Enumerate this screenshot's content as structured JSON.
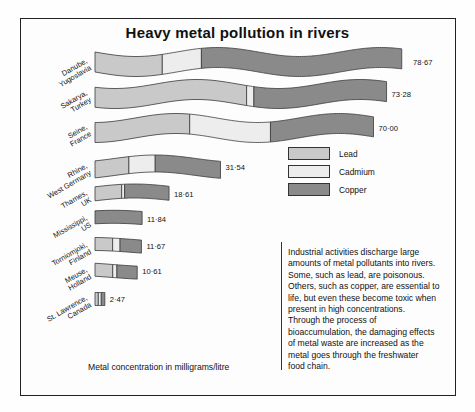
{
  "title": "Heavy metal pollution in rivers",
  "caption": "Metal concentration in milligrams/litre",
  "legend": {
    "items": [
      {
        "label": "Lead",
        "color": "#c9c9c9"
      },
      {
        "label": "Cadmium",
        "color": "#ededed"
      },
      {
        "label": "Copper",
        "color": "#8a8a8a"
      }
    ]
  },
  "paragraph": [
    "Industrial activities discharge large",
    "amounts of metal pollutants into rivers.",
    "Some, such as lead, are poisonous.",
    "Others, such as copper, are essential to",
    "life, but even these become toxic when",
    "present in high concentrations.",
    "Through the process of",
    "bioaccumulation, the damaging effects",
    "of metal waste are increased as the",
    "metal goes through the freshwater",
    "food chain."
  ],
  "chart_data": {
    "type": "bar",
    "title": "Heavy metal pollution in rivers",
    "xlabel": "Metal concentration in milligrams/litre",
    "ylabel": "",
    "unit": "milligrams/litre",
    "stacked": true,
    "series": [
      {
        "name": "Lead",
        "color": "#c9c9c9"
      },
      {
        "name": "Cadmium",
        "color": "#ededed"
      },
      {
        "name": "Copper",
        "color": "#8a8a8a"
      }
    ],
    "categories": [
      "Danube, Yugoslavia",
      "Sakarya, Turkey",
      "Seine, France",
      "Rhine, West Germany",
      "Thames, UK",
      "Mississippi, US",
      "Torniomjoki, Finland",
      "Meuse, Holland",
      "St. Lawrence, Canada"
    ],
    "totals": [
      78.67,
      73.28,
      70.0,
      31.54,
      18.61,
      11.84,
      11.67,
      10.61,
      2.47
    ],
    "total_labels": [
      "78·67",
      "73·28",
      "70·00",
      "31·54",
      "18·61",
      "11·84",
      "11·67",
      "10·61",
      "2·47"
    ],
    "rows": [
      {
        "label1": "Danube,",
        "label2": "Yugoslavia",
        "total_label": "78·67",
        "segments": [
          21.5,
          12.5,
          64.0
        ]
      },
      {
        "label1": "Sakarya,",
        "label2": "Turkey",
        "total_label": "73·28",
        "segments": [
          52.0,
          2.5,
          45.5
        ]
      },
      {
        "label1": "Seine,",
        "label2": "France",
        "total_label": "70·00",
        "segments": [
          34.0,
          29.0,
          37.0
        ]
      },
      {
        "label1": "Rhine,",
        "label2": "West Germany",
        "total_label": "31·54",
        "segments": [
          27.0,
          21.0,
          52.0
        ]
      },
      {
        "label1": "Thames,",
        "label2": "UK",
        "total_label": "18·61",
        "segments": [
          36.0,
          4.0,
          60.0
        ]
      },
      {
        "label1": "Mississippi,",
        "label2": "US",
        "total_label": "11·84",
        "segments": [
          0.0,
          0.0,
          100.0
        ]
      },
      {
        "label1": "Torniomjoki,",
        "label2": "Finland",
        "total_label": "11·67",
        "segments": [
          38.0,
          16.0,
          46.0
        ]
      },
      {
        "label1": "Meuse,",
        "label2": "Holland",
        "total_label": "10·61",
        "segments": [
          42.0,
          10.0,
          48.0
        ]
      },
      {
        "label1": "St. Lawrence,",
        "label2": "Canada",
        "total_label": "2·47",
        "segments": [
          34.0,
          30.0,
          36.0
        ]
      }
    ],
    "grid": false,
    "legend_position": "middle-right"
  }
}
